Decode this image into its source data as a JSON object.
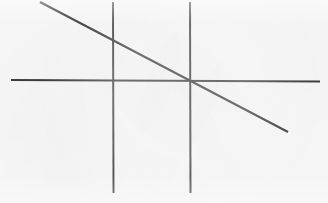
{
  "figure": {
    "kind": "line-diagram",
    "width": 328,
    "height": 203,
    "background_color": "#f7f7f7",
    "stroke_color": "#3c3c3c",
    "caption": "",
    "title": "",
    "intersection_point": {
      "label": "",
      "x": 190,
      "y": 81
    }
  },
  "chart_data": {
    "type": "line",
    "title": "",
    "xlabel": "",
    "ylabel": "",
    "xlim": [
      0,
      328
    ],
    "ylim": [
      203,
      0
    ],
    "grid": false,
    "legend": false,
    "axis_ticks": [],
    "annotations": [],
    "series": [
      {
        "name": "horizontal-line",
        "stroke": "#3c3c3c",
        "stroke_width": 1.9,
        "x": [
          11,
          320
        ],
        "y": [
          80,
          81.5
        ]
      },
      {
        "name": "vertical-line-left",
        "stroke": "#3c3c3c",
        "stroke_width": 1.9,
        "x": [
          113,
          113.5
        ],
        "y": [
          2,
          193
        ]
      },
      {
        "name": "vertical-line-right",
        "stroke": "#3c3c3c",
        "stroke_width": 2.0,
        "x": [
          190,
          190.5
        ],
        "y": [
          2,
          193
        ]
      },
      {
        "name": "diagonal-line",
        "stroke": "#3c3c3c",
        "stroke_width": 2.1,
        "x": [
          40,
          288
        ],
        "y": [
          2,
          132
        ]
      }
    ]
  }
}
